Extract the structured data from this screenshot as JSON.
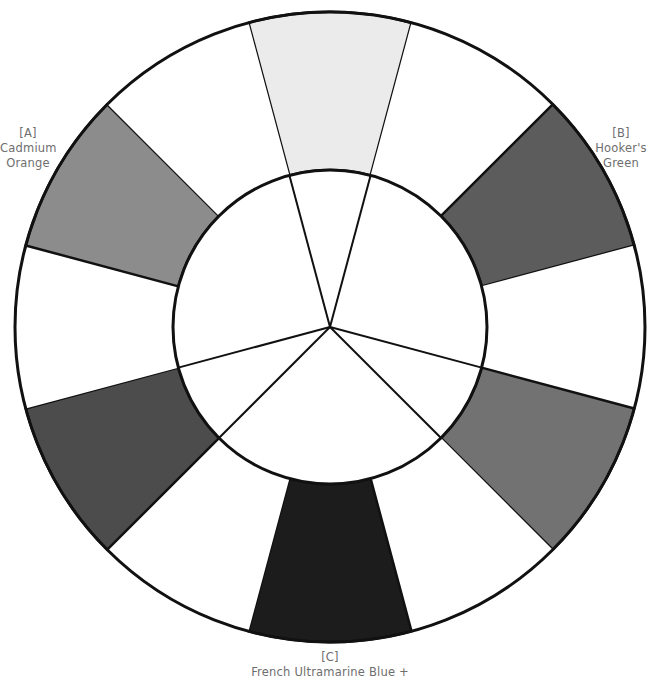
{
  "diagram": {
    "type": "color-wheel",
    "center": [
      330,
      327
    ],
    "outer_radius": 315,
    "inner_radius": 157,
    "stroke_color": "#111111",
    "segments": [
      {
        "position": "top",
        "bearing": 0,
        "fill": "#ebebeb",
        "colored": true
      },
      {
        "position": "top-right",
        "bearing": 30,
        "fill": "#ffffff",
        "colored": false
      },
      {
        "position": "right-upper",
        "bearing": 60,
        "fill": "#5c5c5c",
        "colored": true,
        "primary": "B"
      },
      {
        "position": "right",
        "bearing": 90,
        "fill": "#ffffff",
        "colored": false
      },
      {
        "position": "right-lower",
        "bearing": 120,
        "fill": "#727272",
        "colored": true
      },
      {
        "position": "bottom-right",
        "bearing": 150,
        "fill": "#ffffff",
        "colored": false
      },
      {
        "position": "bottom",
        "bearing": 180,
        "fill": "#1c1c1c",
        "colored": true,
        "primary": "C"
      },
      {
        "position": "bottom-left",
        "bearing": 210,
        "fill": "#ffffff",
        "colored": false
      },
      {
        "position": "left-lower",
        "bearing": 240,
        "fill": "#4c4c4c",
        "colored": true
      },
      {
        "position": "left",
        "bearing": 270,
        "fill": "#ffffff",
        "colored": false
      },
      {
        "position": "left-upper",
        "bearing": 300,
        "fill": "#8c8c8c",
        "colored": true,
        "primary": "A"
      },
      {
        "position": "top-left",
        "bearing": 330,
        "fill": "#ffffff",
        "colored": false
      }
    ],
    "center_lines_bearings": [
      -15,
      15,
      105,
      135,
      225,
      255
    ]
  },
  "labels": {
    "a": {
      "tag": "[A]",
      "line1": "Cadmium",
      "line2": "Orange"
    },
    "b": {
      "tag": "[B]",
      "line1": "Hooker's",
      "line2": "Green"
    },
    "c": {
      "tag": "[C]",
      "line1": "French Ultramarine Blue +"
    }
  }
}
